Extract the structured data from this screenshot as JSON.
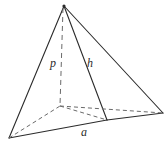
{
  "figure": {
    "name": "pyramid-diagram",
    "background_color": "#ffffff",
    "stroke_color": "#2b2b2b",
    "dashed_stroke_color": "#6a6a6a",
    "labels": {
      "altitude": "p",
      "slant_height": "h",
      "base_edge": "a"
    },
    "geometry": {
      "apex": {
        "x": 64,
        "y": 6
      },
      "base_left": {
        "x": 9,
        "y": 138
      },
      "base_front": {
        "x": 107,
        "y": 120
      },
      "base_right": {
        "x": 163,
        "y": 113
      },
      "base_back_hidden": {
        "x": 60,
        "y": 106
      },
      "foot_of_altitude": {
        "x": 60,
        "y": 106
      }
    },
    "edges": [
      {
        "name": "apex-to-base-left",
        "style": "solid"
      },
      {
        "name": "apex-to-base-front",
        "style": "solid"
      },
      {
        "name": "apex-to-base-right",
        "style": "solid"
      },
      {
        "name": "base-left-to-base-front",
        "style": "solid"
      },
      {
        "name": "base-front-to-base-right",
        "style": "solid"
      },
      {
        "name": "base-left-to-base-back-hidden",
        "style": "dashed"
      },
      {
        "name": "base-back-hidden-to-base-front",
        "style": "dashed"
      },
      {
        "name": "base-back-hidden-to-base-right",
        "style": "dashed"
      },
      {
        "name": "altitude-apex-to-foot",
        "style": "dashed"
      }
    ]
  }
}
